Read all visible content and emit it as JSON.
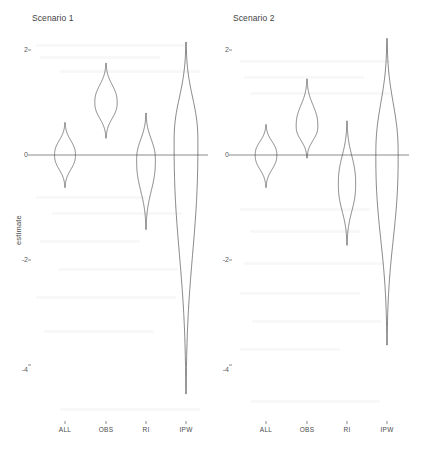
{
  "figure": {
    "width": 435,
    "height": 463,
    "background": "#ffffff",
    "line_color": "#3d3d3d",
    "axis_color": "#5a5a5a"
  },
  "panels": [
    {
      "id": "panel1",
      "title": "Scenario 1"
    },
    {
      "id": "panel2",
      "title": "Scenario 2"
    }
  ],
  "axes": {
    "y_title": "estimate",
    "y_ticks": [
      "2",
      "0",
      "-2",
      "-4"
    ],
    "y_tick_values": [
      2,
      0,
      -2,
      -4
    ],
    "x_ticks": [
      "ALL",
      "OBS",
      "RI",
      "IPW"
    ],
    "ylim": [
      -4.9,
      2.3
    ],
    "grid": false,
    "legend": "none"
  },
  "chart_data": {
    "type": "violin",
    "title": "",
    "subtitle": "",
    "xlabel": "",
    "ylabel": "estimate",
    "ylim": [
      -4.9,
      2.3
    ],
    "y_ticks": [
      2,
      0,
      -2,
      -4
    ],
    "categories": [
      "ALL",
      "OBS",
      "RI",
      "IPW"
    ],
    "grid": false,
    "legend_position": "none",
    "panels": [
      {
        "name": "Scenario 1",
        "violins": [
          {
            "category": "ALL",
            "center": 0.0,
            "median": 0.0,
            "half_width": 0.58,
            "lower": -0.62,
            "upper": 0.62,
            "tail_lower": -0.62,
            "tail_upper": 0.62
          },
          {
            "category": "OBS",
            "center": 1.0,
            "median": 1.0,
            "half_width": 0.62,
            "lower": 0.32,
            "upper": 1.72,
            "tail_lower": 0.32,
            "tail_upper": 1.75
          },
          {
            "category": "RI",
            "center": -0.1,
            "median": -0.1,
            "half_width": 0.52,
            "lower": -1.38,
            "upper": 0.78,
            "tail_lower": -1.42,
            "tail_upper": 0.8
          },
          {
            "category": "IPW",
            "center": 0.25,
            "median": 0.25,
            "half_width": 0.66,
            "lower": -4.55,
            "upper": 2.15,
            "tail_lower": -4.55,
            "tail_upper": 2.15
          }
        ]
      },
      {
        "name": "Scenario 2",
        "violins": [
          {
            "category": "ALL",
            "center": 0.0,
            "median": 0.0,
            "half_width": 0.6,
            "lower": -0.6,
            "upper": 0.58,
            "tail_lower": -0.62,
            "tail_upper": 0.58
          },
          {
            "category": "OBS",
            "center": 0.55,
            "median": 0.55,
            "half_width": 0.6,
            "lower": -0.05,
            "upper": 1.42,
            "tail_lower": -0.06,
            "tail_upper": 1.45
          },
          {
            "category": "RI",
            "center": -0.55,
            "median": -0.55,
            "half_width": 0.48,
            "lower": -1.7,
            "upper": 0.62,
            "tail_lower": -1.72,
            "tail_upper": 0.65
          },
          {
            "category": "IPW",
            "center": 0.0,
            "median": 0.0,
            "half_width": 0.62,
            "lower": -3.6,
            "upper": 2.22,
            "tail_lower": -3.62,
            "tail_upper": 2.22
          }
        ]
      }
    ]
  }
}
